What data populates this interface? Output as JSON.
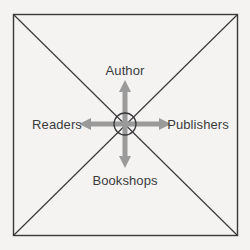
{
  "diagram": {
    "background_color": "#f4f3f1",
    "line_color": "#3a3a3c",
    "arrow_color": "#9a9a9a",
    "text_color": "#3b3b3d",
    "frame": {
      "shape": "square",
      "x": 13,
      "y": 14,
      "width": 225,
      "height": 222,
      "stroke_width": 1.4
    },
    "diagonals": {
      "count": 2,
      "description": "two diagonals from corner to corner crossing at the hub"
    },
    "hub": {
      "shape": "circle",
      "cx": 125,
      "cy": 124,
      "r": 11,
      "stroke_width": 1.3,
      "fill": "none"
    },
    "nodes": [
      {
        "id": "author",
        "label": "Author",
        "position": "top"
      },
      {
        "id": "readers",
        "label": "Readers",
        "position": "left"
      },
      {
        "id": "publishers",
        "label": "Publishers",
        "position": "right"
      },
      {
        "id": "bookshops",
        "label": "Bookshops",
        "position": "bottom"
      }
    ],
    "arrows": [
      {
        "id": "arrow-up",
        "direction": "up",
        "from": [
          125,
          124
        ],
        "to": [
          125,
          82
        ]
      },
      {
        "id": "arrow-down",
        "direction": "down",
        "from": [
          125,
          124
        ],
        "to": [
          125,
          166
        ]
      },
      {
        "id": "arrow-left",
        "direction": "left",
        "from": [
          125,
          124
        ],
        "to": [
          81,
          124
        ]
      },
      {
        "id": "arrow-right",
        "direction": "right",
        "from": [
          125,
          124
        ],
        "to": [
          169,
          124
        ]
      }
    ]
  }
}
